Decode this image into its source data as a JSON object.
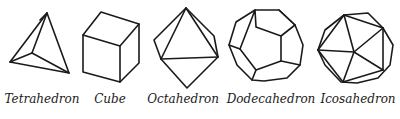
{
  "figure": {
    "type": "platonic-solids-diagram",
    "stroke_color": "#1a1a1a",
    "background": "#ffffff",
    "solids": [
      {
        "name": "Tetrahedron",
        "faces": 4
      },
      {
        "name": "Cube",
        "faces": 6
      },
      {
        "name": "Octahedron",
        "faces": 8
      },
      {
        "name": "Dodecahedron",
        "faces": 12
      },
      {
        "name": "Icosahedron",
        "faces": 20
      }
    ]
  }
}
